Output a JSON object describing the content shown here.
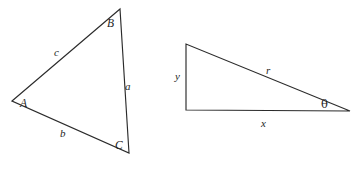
{
  "figure": {
    "background_color": "#ffffff",
    "stroke_color": "#2b2b2b",
    "label_color": "#1e1e1e",
    "width": 354,
    "height": 171
  },
  "oblique_triangle": {
    "name": "triangle-abc",
    "description": "Scalene triangle with vertices A, B, C and sides a, b, c",
    "vertices": [
      {
        "label": "A",
        "x": 12,
        "y": 101,
        "label_x": 20,
        "label_y": 107
      },
      {
        "label": "B",
        "x": 120,
        "y": 9,
        "label_x": 107,
        "label_y": 27
      },
      {
        "label": "C",
        "x": 129,
        "y": 153,
        "label_x": 115,
        "label_y": 149
      }
    ],
    "sides": [
      {
        "label": "a",
        "from": "B",
        "to": "C",
        "label_x": 125,
        "label_y": 90
      },
      {
        "label": "b",
        "from": "A",
        "to": "C",
        "label_x": 60,
        "label_y": 137
      },
      {
        "label": "c",
        "from": "A",
        "to": "B",
        "label_x": 54,
        "label_y": 56
      }
    ]
  },
  "right_triangle": {
    "name": "triangle-xyr",
    "description": "Right triangle with legs x and y, hypotenuse r, and angle theta",
    "vertices": [
      {
        "role": "top-left",
        "x": 186,
        "y": 44
      },
      {
        "role": "bottom-left",
        "x": 186,
        "y": 110
      },
      {
        "role": "bottom-right",
        "x": 350,
        "y": 111
      }
    ],
    "sides": [
      {
        "label": "y",
        "role": "vertical-leg",
        "label_x": 175,
        "label_y": 80
      },
      {
        "label": "r",
        "role": "hypotenuse",
        "label_x": 266,
        "label_y": 74
      },
      {
        "label": "x",
        "role": "horizontal-leg",
        "label_x": 261,
        "label_y": 127
      }
    ],
    "angles": [
      {
        "label": "θ",
        "role": "angle-at-bottom-right",
        "label_x": 321,
        "label_y": 108
      }
    ]
  }
}
